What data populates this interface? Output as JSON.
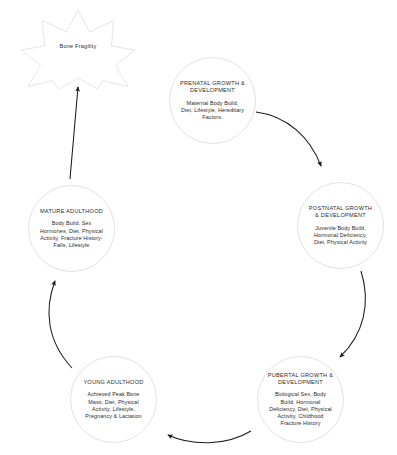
{
  "diagram": {
    "outcome": {
      "shape": "star",
      "label": "Bone Fragility"
    },
    "stroke_color": "#e2e2e2",
    "arrow_color": "#1a1a1a",
    "text_color": "#2b2b2b",
    "nodes": [
      {
        "id": "prenatal",
        "title": "PRENATAL GROWTH &\nDEVELOPMENT",
        "body": "Maternal Body Build,\nDiet, Lifestyle, Hereditary\nFactors."
      },
      {
        "id": "postnatal",
        "title": "POSTNATAL GROWTH\n& DEVELOPMENT",
        "body": "Juvenile Body Build,\nHormonal Deficiency,\nDiet, Physical Activity"
      },
      {
        "id": "pubertal",
        "title": "PUBERTAL GROWTH &\nDEVELOPMENT",
        "body": "Biological Sex, Body\nBuild, Hormonal\nDeficiency, Diet, Physical\nActivity, Childhood\nFracture History"
      },
      {
        "id": "young-adulthood",
        "title": "YOUNG ADULTHOOD",
        "body": "Achieved Peak Bone\nMass, Diet, Physical\nActivity, Lifestyle,\nPregnancy & Lactation"
      },
      {
        "id": "mature-adulthood",
        "title": "MATURE ADULTHOOD",
        "body": "Body Build, Sex\nHormones, Diet, Physical\nActivity, Fracture History-\nFalls, Lifestyle"
      }
    ],
    "edges": [
      {
        "id": "prenatal-to-postnatal",
        "from": "prenatal",
        "to": "postnatal",
        "style": "curved-arrow"
      },
      {
        "id": "postnatal-to-pubertal",
        "from": "postnatal",
        "to": "pubertal",
        "style": "curved-arrow"
      },
      {
        "id": "pubertal-to-young-adulthood",
        "from": "pubertal",
        "to": "young-adulthood",
        "style": "curved-arrow"
      },
      {
        "id": "young-adulthood-to-mature-adulthood",
        "from": "young-adulthood",
        "to": "mature-adulthood",
        "style": "curved-arrow"
      },
      {
        "id": "mature-adulthood-to-bone-fragility",
        "from": "mature-adulthood",
        "to": "outcome",
        "style": "straight-arrow"
      }
    ]
  }
}
